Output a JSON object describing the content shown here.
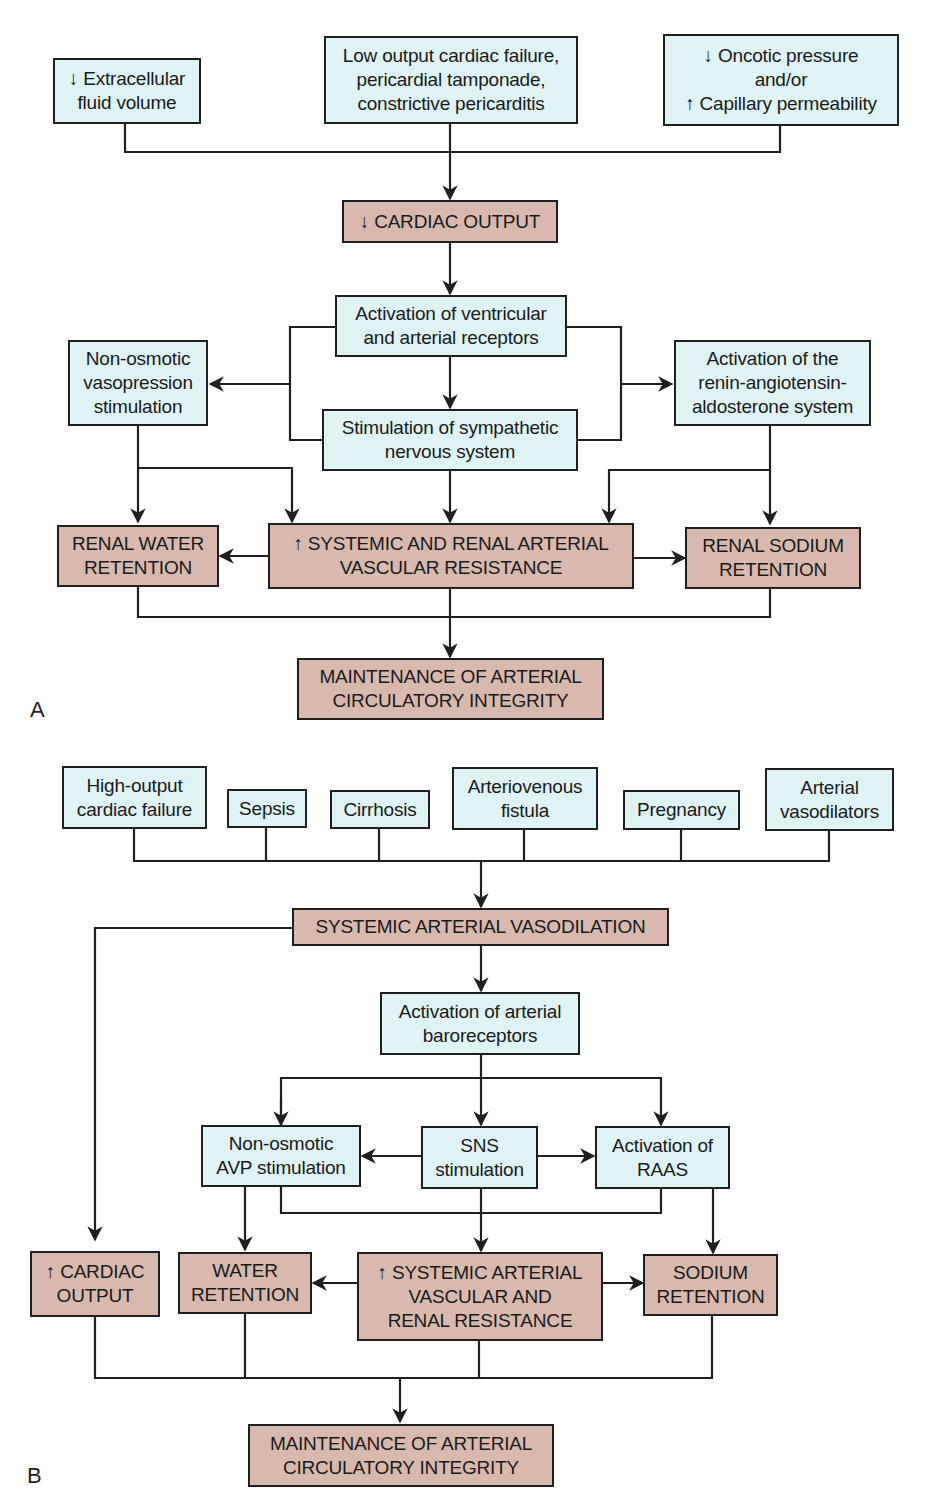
{
  "panel_a": {
    "label": "A",
    "causes": [
      "↓ Extracellular\nfluid volume",
      "Low output cardiac failure,\npericardial tamponade,\nconstrictive pericarditis",
      "↓ Oncotic pressure\nand/or\n↑ Capillary permeability"
    ],
    "cardiac_output": "↓ CARDIAC OUTPUT",
    "receptors": "Activation of ventricular\nand arterial receptors",
    "vasopressin": "Non-osmotic\nvasopression\nstimulation",
    "raas": "Activation of the\nrenin-angiotensin-\naldosterone system",
    "sympathetic": "Stimulation of sympathetic\nnervous system",
    "water_retention": "RENAL WATER\nRETENTION",
    "resistance": "↑ SYSTEMIC AND RENAL ARTERIAL\nVASCULAR RESISTANCE",
    "sodium_retention": "RENAL SODIUM\nRETENTION",
    "outcome": "MAINTENANCE OF ARTERIAL\nCIRCULATORY INTEGRITY"
  },
  "panel_b": {
    "label": "B",
    "causes": [
      "High-output\ncardiac failure",
      "Sepsis",
      "Cirrhosis",
      "Arteriovenous\nfistula",
      "Pregnancy",
      "Arterial\nvasodilators"
    ],
    "vasodilation": "SYSTEMIC ARTERIAL VASODILATION",
    "baroreceptors": "Activation of arterial\nbaroreceptors",
    "avp": "Non-osmotic\nAVP stimulation",
    "sns": "SNS\nstimulation",
    "raas": "Activation of\nRAAS",
    "cardiac_output": "↑ CARDIAC\nOUTPUT",
    "water_retention": "WATER\nRETENTION",
    "resistance": "↑ SYSTEMIC ARTERIAL\nVASCULAR AND\nRENAL RESISTANCE",
    "sodium_retention": "SODIUM\nRETENTION",
    "outcome": "MAINTENANCE OF ARTERIAL\nCIRCULATORY INTEGRITY"
  },
  "colors": {
    "cause_fill": "#dff3f5",
    "effect_fill": "#d9b9ae",
    "stroke": "#1f1f1f"
  }
}
